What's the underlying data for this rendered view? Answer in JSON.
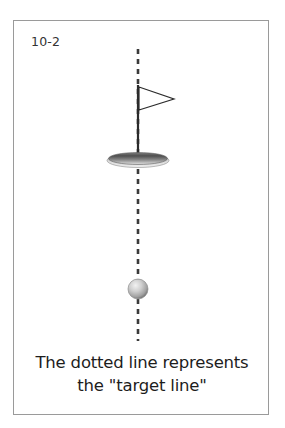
{
  "figure": {
    "number_label": "10-2",
    "caption_lines": [
      "The dotted line represents",
      "the \"target line\""
    ],
    "caption_full": "The dotted line represents the \"target line\""
  },
  "colors": {
    "card_border": "#9a9a9a",
    "background": "#ffffff",
    "label_text": "#333333",
    "caption_text": "#1d1d1d",
    "target_line": "#3a3a3a",
    "flag_outline": "#2b2b2b",
    "flagpole": "#2b2b2b",
    "hole_dark": "#4a4a4a",
    "hole_light": "#d8d8d8",
    "ball_light": "#f0f0f0",
    "ball_mid": "#b8b8b8",
    "ball_dark": "#6e6e6e"
  },
  "diagram": {
    "elements": [
      {
        "name": "target-line",
        "type": "dashed-vertical-line",
        "description": "Vertical dotted line running from top of figure through the hole and the ball"
      },
      {
        "name": "flag",
        "type": "triangle-outline",
        "description": "Right-pointing flag outline attached to the flagpole"
      },
      {
        "name": "flagpole",
        "type": "vertical-line",
        "description": "Solid pole from flag down into the hole"
      },
      {
        "name": "hole",
        "type": "ellipse",
        "description": "Shaded ellipse representing the golf hole / cup"
      },
      {
        "name": "golf-ball",
        "type": "sphere",
        "description": "Shaded sphere representing the golf ball on the target line"
      }
    ],
    "geometry": {
      "line_x": 124,
      "line_top_y": 28,
      "line_bottom_y": 320,
      "dash_length": 5,
      "dash_gap": 5,
      "dash_width": 2.5,
      "flag_pole_top_y": 65,
      "flag_pole_bottom_y": 141,
      "flag_tip_x": 160,
      "flag_top_y": 66,
      "flag_bottom_y": 88,
      "hole_cx": 124,
      "hole_cy": 138,
      "hole_rx": 31,
      "hole_ry": 7,
      "ball_cx": 124,
      "ball_cy": 268,
      "ball_r": 10
    }
  }
}
